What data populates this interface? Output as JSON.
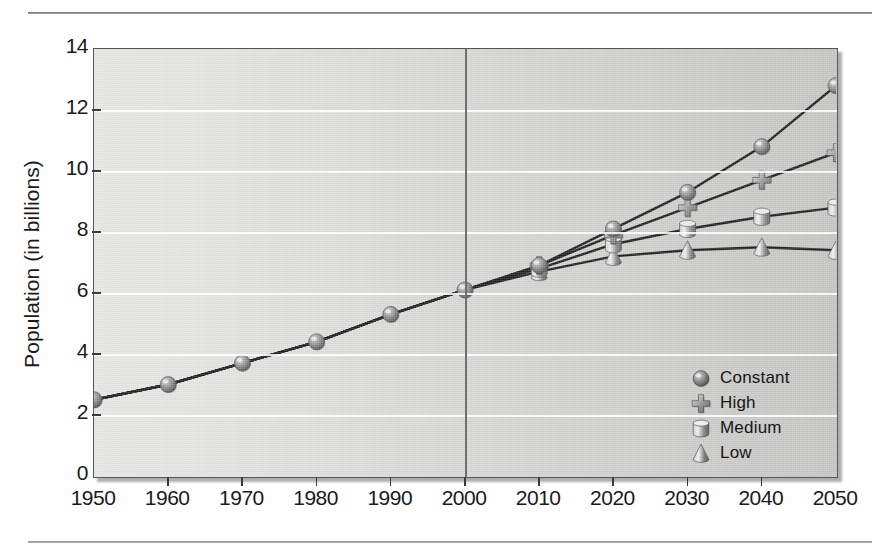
{
  "chart_data": {
    "type": "line",
    "title": "",
    "xlabel": "",
    "ylabel": "Population (in billions)",
    "x": [
      1950,
      1960,
      1970,
      1980,
      1990,
      2000,
      2010,
      2020,
      2030,
      2040,
      2050
    ],
    "xtick_labels": [
      "1950",
      "1960",
      "1970",
      "1980",
      "1990",
      "2000",
      "2010",
      "2020",
      "2030",
      "2040",
      "2050"
    ],
    "ytick_labels": [
      "0",
      "2",
      "4",
      "6",
      "8",
      "10",
      "12",
      "14"
    ],
    "yticks": [
      0,
      2,
      4,
      6,
      8,
      10,
      12,
      14
    ],
    "xlim": [
      1950,
      2050
    ],
    "ylim": [
      0,
      14
    ],
    "grid": "horizontal",
    "legend_position": "lower-right",
    "projection_divider_x": 2000,
    "series": [
      {
        "name": "Constant",
        "marker": "sphere",
        "values": [
          2.5,
          3.0,
          3.7,
          4.4,
          5.3,
          6.1,
          6.9,
          8.1,
          9.3,
          10.8,
          12.8
        ]
      },
      {
        "name": "High",
        "marker": "cross",
        "values": [
          2.5,
          3.0,
          3.7,
          4.4,
          5.3,
          6.1,
          6.9,
          7.9,
          8.8,
          9.7,
          10.6
        ]
      },
      {
        "name": "Medium",
        "marker": "cylinder",
        "values": [
          2.5,
          3.0,
          3.7,
          4.4,
          5.3,
          6.1,
          6.8,
          7.6,
          8.1,
          8.5,
          8.8
        ]
      },
      {
        "name": "Low",
        "marker": "cone",
        "values": [
          2.5,
          3.0,
          3.7,
          4.4,
          5.3,
          6.1,
          6.7,
          7.2,
          7.4,
          7.5,
          7.4
        ]
      }
    ]
  },
  "legend": {
    "items": [
      {
        "label": "Constant",
        "marker": "sphere"
      },
      {
        "label": "High",
        "marker": "cross"
      },
      {
        "label": "Medium",
        "marker": "cylinder"
      },
      {
        "label": "Low",
        "marker": "cone"
      }
    ]
  },
  "colors": {
    "line": "#1c1c1c",
    "plot_background_light": "#e6e6e4",
    "plot_background_dark": "#c4c4c2",
    "gridline": "#ffffff",
    "divider": "#6e6e6e",
    "marker_light": "#d9d9d9",
    "marker_dark": "#6a6a6a",
    "text": "#1a1a1a",
    "page_background": "#fefefe"
  }
}
